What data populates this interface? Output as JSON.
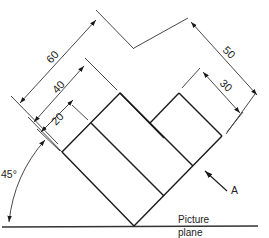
{
  "figure": {
    "type": "orthographic-projection-at-45-degrees",
    "dimensions": {
      "dim_60": "60",
      "dim_40": "40",
      "dim_20": "20",
      "dim_50": "50",
      "dim_30": "30"
    },
    "angle_label": "45°",
    "view_arrow_label": "A",
    "picture_plane_label_line1": "Picture",
    "picture_plane_label_line2": "plane"
  },
  "colors": {
    "line": "#1a1a1a",
    "dim_line": "#333333",
    "background": "#ffffff"
  }
}
